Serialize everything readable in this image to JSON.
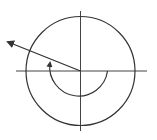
{
  "diagram": {
    "type": "angle-in-standard-position",
    "stroke_color": "#333333",
    "background": "#ffffff",
    "center": [
      80,
      71
    ],
    "circle_radius": 54,
    "arc_radius": 27,
    "x_axis": {
      "from": 16,
      "to": 147
    },
    "y_axis": {
      "from": 11,
      "to": 131
    },
    "terminal_ray_end": [
      8,
      42
    ],
    "arc": {
      "start_angle_deg": 0,
      "direction": "clockwise",
      "end_arrow": true
    }
  }
}
